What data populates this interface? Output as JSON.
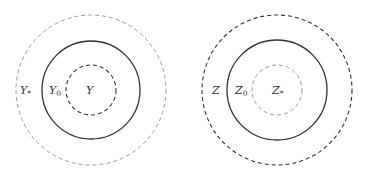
{
  "diagrams": [
    {
      "name": "left",
      "center": [
        91,
        90
      ],
      "circles": [
        {
          "role": "outer",
          "r": 75,
          "style": "dashed",
          "color": "#9a9a9a"
        },
        {
          "role": "middle",
          "r": 49,
          "style": "solid",
          "color": "#333333"
        },
        {
          "role": "inner",
          "r": 25,
          "style": "dashed",
          "color": "#333333"
        }
      ],
      "labels": [
        {
          "base": "Y",
          "sub": "*",
          "x": 20,
          "y": 94
        },
        {
          "base": "Y",
          "sub": "0",
          "x": 49,
          "y": 94
        },
        {
          "base": "Y",
          "sub": "",
          "x": 86,
          "y": 94
        }
      ]
    },
    {
      "name": "right",
      "center": [
        277,
        90
      ],
      "circles": [
        {
          "role": "outer",
          "r": 75,
          "style": "dashed",
          "color": "#333333"
        },
        {
          "role": "middle",
          "r": 50,
          "style": "solid",
          "color": "#333333"
        },
        {
          "role": "inner",
          "r": 25,
          "style": "dashed",
          "color": "#9a9a9a"
        }
      ],
      "labels": [
        {
          "base": "Z",
          "sub": "",
          "x": 212,
          "y": 94
        },
        {
          "base": "Z",
          "sub": "0",
          "x": 235,
          "y": 94
        },
        {
          "base": "Z",
          "sub": "*",
          "x": 272,
          "y": 94
        }
      ]
    }
  ]
}
